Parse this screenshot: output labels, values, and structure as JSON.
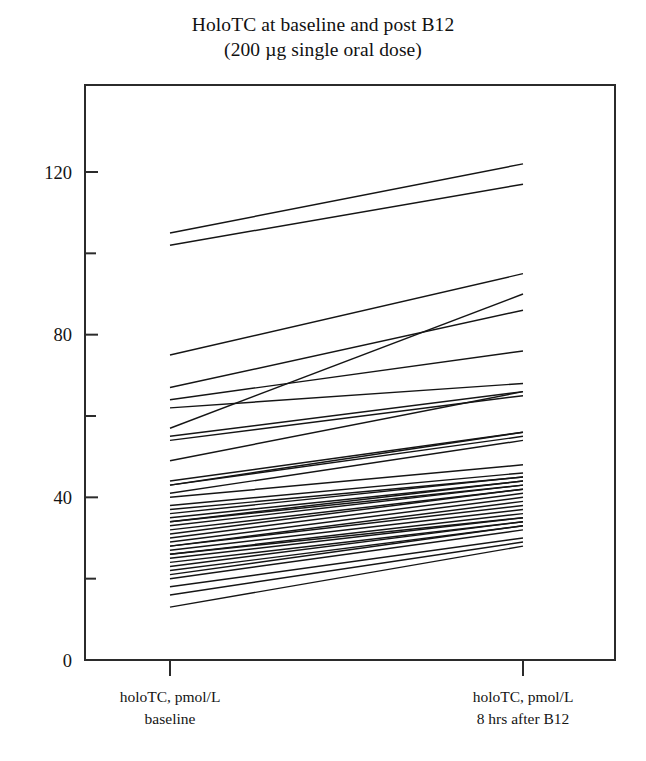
{
  "figure": {
    "title_line1": "HoloTC at baseline and post B12",
    "title_line2": "(200 µg single oral dose)",
    "background_color": "#ffffff",
    "line_color": "#151515",
    "axis_color": "#2b2b2b"
  },
  "axis": {
    "y_tick_labels": [
      "0",
      "40",
      "80",
      "120"
    ],
    "y_minor_ticks": [
      "20",
      "60",
      "100"
    ],
    "x_label_left_line1": "holoTC, pmol/L",
    "x_label_left_line2": "baseline",
    "x_label_right_line1": "holoTC, pmol/L",
    "x_label_right_line2": "8 hrs after B12"
  },
  "chart_data": {
    "type": "line",
    "title": "HoloTC at baseline and post B12 (200 µg single oral dose)",
    "subtitle": "(200 µg single oral dose)",
    "xlabel": "",
    "ylabel": "holoTC, pmol/L",
    "categories": [
      "holoTC, pmol/L baseline",
      "holoTC, pmol/L 8 hrs after B12"
    ],
    "x": [
      0,
      1
    ],
    "ylim": [
      0,
      130
    ],
    "xlim": [
      -0.24,
      1.26
    ],
    "y_ticks": [
      0,
      40,
      80,
      120
    ],
    "y_minor_ticks": [
      20,
      60,
      100
    ],
    "grid": false,
    "legend": "none",
    "plot_style": "paired slope (spaghetti) chart, one line per subject",
    "n_subjects": 40,
    "series": [
      {
        "name": "subject-01",
        "values": [
          105,
          122
        ]
      },
      {
        "name": "subject-02",
        "values": [
          102,
          117
        ]
      },
      {
        "name": "subject-03",
        "values": [
          75,
          95
        ]
      },
      {
        "name": "subject-04",
        "values": [
          67,
          86
        ]
      },
      {
        "name": "subject-05",
        "values": [
          57,
          90
        ]
      },
      {
        "name": "subject-06",
        "values": [
          64,
          76
        ]
      },
      {
        "name": "subject-07",
        "values": [
          62,
          68
        ]
      },
      {
        "name": "subject-08",
        "values": [
          55,
          66
        ]
      },
      {
        "name": "subject-09",
        "values": [
          54,
          65
        ]
      },
      {
        "name": "subject-10",
        "values": [
          49,
          66
        ]
      },
      {
        "name": "subject-11",
        "values": [
          44,
          56
        ]
      },
      {
        "name": "subject-12",
        "values": [
          43,
          56
        ]
      },
      {
        "name": "subject-13",
        "values": [
          43,
          55
        ]
      },
      {
        "name": "subject-14",
        "values": [
          41,
          54
        ]
      },
      {
        "name": "subject-15",
        "values": [
          40,
          48
        ]
      },
      {
        "name": "subject-16",
        "values": [
          38,
          46
        ]
      },
      {
        "name": "subject-17",
        "values": [
          37,
          45
        ]
      },
      {
        "name": "subject-18",
        "values": [
          36,
          45
        ]
      },
      {
        "name": "subject-19",
        "values": [
          35,
          44
        ]
      },
      {
        "name": "subject-20",
        "values": [
          34,
          44
        ]
      },
      {
        "name": "subject-21",
        "values": [
          34,
          43
        ]
      },
      {
        "name": "subject-22",
        "values": [
          33,
          43
        ]
      },
      {
        "name": "subject-23",
        "values": [
          32,
          42
        ]
      },
      {
        "name": "subject-24",
        "values": [
          31,
          42
        ]
      },
      {
        "name": "subject-25",
        "values": [
          30,
          41
        ]
      },
      {
        "name": "subject-26",
        "values": [
          29,
          40
        ]
      },
      {
        "name": "subject-27",
        "values": [
          28,
          39
        ]
      },
      {
        "name": "subject-28",
        "values": [
          28,
          38
        ]
      },
      {
        "name": "subject-29",
        "values": [
          27,
          37
        ]
      },
      {
        "name": "subject-30",
        "values": [
          26,
          36
        ]
      },
      {
        "name": "subject-31",
        "values": [
          26,
          35
        ]
      },
      {
        "name": "subject-32",
        "values": [
          25,
          35
        ]
      },
      {
        "name": "subject-33",
        "values": [
          24,
          34
        ]
      },
      {
        "name": "subject-34",
        "values": [
          23,
          34
        ]
      },
      {
        "name": "subject-35",
        "values": [
          22,
          33
        ]
      },
      {
        "name": "subject-36",
        "values": [
          21,
          33
        ]
      },
      {
        "name": "subject-37",
        "values": [
          20,
          32
        ]
      },
      {
        "name": "subject-38",
        "values": [
          18,
          30
        ]
      },
      {
        "name": "subject-39",
        "values": [
          16,
          29
        ]
      },
      {
        "name": "subject-40",
        "values": [
          13,
          28
        ]
      }
    ]
  }
}
